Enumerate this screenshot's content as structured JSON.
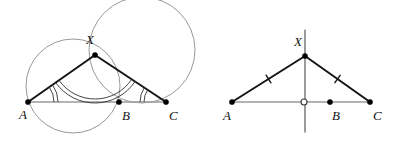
{
  "figure": {
    "background_color": "#ffffff",
    "width": 394,
    "height": 152,
    "panels": [
      {
        "id": "left",
        "name": "circumcircles-and-equal-angles",
        "points": [
          {
            "key": "A",
            "label": "A",
            "x": 28,
            "y": 102,
            "label_x": 19,
            "label_y": 119,
            "marker": "filled"
          },
          {
            "key": "B",
            "label": "B",
            "x": 119,
            "y": 102,
            "label_x": 122,
            "label_y": 120,
            "marker": "filled"
          },
          {
            "key": "C",
            "label": "C",
            "x": 166,
            "y": 102,
            "label_x": 169,
            "label_y": 120,
            "marker": "filled"
          },
          {
            "key": "X",
            "label": "X",
            "x": 95,
            "y": 55,
            "label_x": 86,
            "label_y": 44,
            "marker": "filled"
          }
        ],
        "segments": [
          {
            "name": "segment-AC",
            "from": "A",
            "to": "C",
            "style": "base"
          },
          {
            "name": "segment-AX",
            "from": "A",
            "to": "X",
            "style": "ray"
          },
          {
            "name": "segment-XC",
            "from": "X",
            "to": "C",
            "style": "ray"
          }
        ],
        "circles": [
          {
            "name": "circle-AXB",
            "cx": 73,
            "cy": 86,
            "r": 47,
            "through": [
              "A",
              "X",
              "B"
            ]
          },
          {
            "name": "circle-XBC",
            "cx": 142,
            "cy": 50,
            "r": 53,
            "through": [
              "X",
              "B",
              "C"
            ]
          }
        ],
        "angle_marks": [
          {
            "name": "angle-mark-at-A",
            "vertex": "A",
            "arcs": 2,
            "radius": 30
          },
          {
            "name": "angle-mark-at-C",
            "vertex": "C",
            "arcs": 2,
            "radius": 26
          },
          {
            "name": "angle-mark-at-X-left",
            "vertex": "X",
            "arcs": 2,
            "radius": 48
          }
        ]
      },
      {
        "id": "right",
        "name": "perpendicular-bisector-and-equal-sides",
        "points": [
          {
            "key": "A",
            "label": "A",
            "x": 232,
            "y": 102,
            "label_x": 223,
            "label_y": 120,
            "marker": "filled"
          },
          {
            "key": "M",
            "label": "",
            "x": 304,
            "y": 102,
            "label_x": 0,
            "label_y": 0,
            "marker": "open"
          },
          {
            "key": "B",
            "label": "B",
            "x": 330,
            "y": 102,
            "label_x": 332,
            "label_y": 120,
            "marker": "filled"
          },
          {
            "key": "C",
            "label": "C",
            "x": 370,
            "y": 102,
            "label_x": 373,
            "label_y": 120,
            "marker": "filled"
          },
          {
            "key": "X",
            "label": "X",
            "x": 305,
            "y": 56,
            "label_x": 294,
            "label_y": 46,
            "marker": "filled"
          }
        ],
        "segments": [
          {
            "name": "segment-AC",
            "from": "A",
            "to": "C",
            "style": "base"
          },
          {
            "name": "segment-AX",
            "from": "A",
            "to": "X",
            "style": "ray"
          },
          {
            "name": "segment-XC",
            "from": "X",
            "to": "C",
            "style": "ray"
          }
        ],
        "perpendicular_bisector": {
          "name": "perpendicular-bisector-line",
          "x": 305,
          "y_top": 30,
          "y_bottom": 132
        },
        "tick_marks": [
          {
            "name": "tick-on-AX",
            "segment": "AX",
            "count": 1,
            "t": 0.5
          },
          {
            "name": "tick-on-XC",
            "segment": "XC",
            "count": 1,
            "t": 0.5
          }
        ]
      }
    ],
    "colors": {
      "base_line": "#9a9a9a",
      "ray_line": "#141414",
      "circle_stroke": "#6b6b6b",
      "perp_line": "#4a4a4a",
      "label_text": "#111111",
      "dot_fill": "#000000",
      "open_dot_fill": "#ffffff"
    }
  }
}
